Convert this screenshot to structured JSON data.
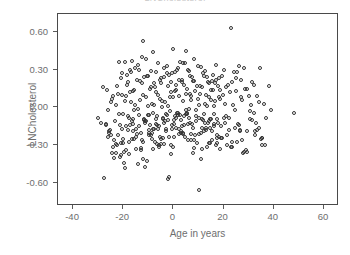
{
  "chart_data": {
    "type": "scatter",
    "title": "LNCholesterol",
    "xlabel": "Age in years",
    "ylabel": "LNCholesterol",
    "xlim": [
      -46,
      66
    ],
    "ylim": [
      -0.78,
      0.74
    ],
    "xticks": [
      -40,
      -20,
      0,
      20,
      40,
      60
    ],
    "xtick_labels": [
      "-40",
      "-20",
      "0",
      "20",
      "40",
      "60"
    ],
    "yticks": [
      0.6,
      0.3,
      0.0,
      -0.3,
      -0.6
    ],
    "ytick_labels": [
      "0.60",
      "0.30",
      "0.00",
      "-0.30",
      "-0.60"
    ],
    "grid": false,
    "legend": null,
    "marker": {
      "shape": "open-circle",
      "size_px": 4,
      "edge_color": "#333333",
      "fill": "none"
    },
    "frame_color": "#4a4a4a",
    "text_color": "#6e6e6e",
    "background": "#ffffff",
    "n_points": 400,
    "series": [
      {
        "name": "observations",
        "x": [
          -27.6,
          -26.4,
          -26.0,
          -25.2,
          -24.6,
          -24.0,
          -23.4,
          -22.8,
          -22.2,
          -21.6,
          -21.0,
          -20.4,
          -20.0,
          -19.4,
          -19.0,
          -18.6,
          -18.0,
          -17.6,
          -17.0,
          -16.4,
          -16.0,
          -15.6,
          -15.0,
          -14.4,
          -14.0,
          -13.6,
          -13.0,
          -12.6,
          -12.0,
          -11.4,
          -11.0,
          -10.6,
          -10.0,
          -9.6,
          -9.0,
          -8.6,
          -8.0,
          -7.6,
          -7.0,
          -6.6,
          -6.0,
          -5.6,
          -5.0,
          -4.6,
          -4.0,
          -3.6,
          -3.0,
          -2.6,
          -2.0,
          -1.6,
          -1.0,
          -0.6,
          0.0,
          0.4,
          1.0,
          1.4,
          2.0,
          2.4,
          3.0,
          3.4,
          4.0,
          4.4,
          5.0,
          5.4,
          6.0,
          6.4,
          7.0,
          7.4,
          8.0,
          8.4,
          9.0,
          9.4,
          10.0,
          10.4,
          11.0,
          11.4,
          12.0,
          12.6,
          13.0,
          13.6,
          14.0,
          14.6,
          15.0,
          15.6,
          16.0,
          16.6,
          17.0,
          17.6,
          18.0,
          18.6,
          19.0,
          20.0,
          21.0,
          22.0,
          23.0,
          24.0,
          25.0,
          26.0,
          27.0,
          28.0,
          -28.0,
          -25.8,
          -24.2,
          -23.0,
          -22.0,
          -21.2,
          -20.6,
          -19.8,
          -19.2,
          -18.4,
          -17.8,
          -17.2,
          -16.6,
          -16.2,
          -15.4,
          -14.8,
          -14.2,
          -13.8,
          -13.2,
          -12.8,
          -12.2,
          -11.8,
          -11.2,
          -10.8,
          -10.2,
          -9.8,
          -9.2,
          -8.8,
          -8.2,
          -7.8,
          -7.2,
          -6.8,
          -6.2,
          -5.8,
          -5.2,
          -4.8,
          -4.2,
          -3.8,
          -3.2,
          -2.8,
          -2.2,
          -1.8,
          -1.2,
          -0.8,
          -0.2,
          0.2,
          0.8,
          1.2,
          1.8,
          2.2,
          2.8,
          3.2,
          3.8,
          4.2,
          4.8,
          5.2,
          5.8,
          6.2,
          6.8,
          7.2,
          7.8,
          8.2,
          8.8,
          9.2,
          9.8,
          10.2,
          10.8,
          11.2,
          11.8,
          12.2,
          12.8,
          13.2,
          13.8,
          14.2,
          14.8,
          15.2,
          15.8,
          16.2,
          16.8,
          17.2,
          17.8,
          18.2,
          18.8,
          19.4,
          20.4,
          21.4,
          22.4,
          23.4,
          24.4,
          25.4,
          26.4,
          27.4,
          28.4,
          29.0,
          30.0,
          31.0,
          32.0,
          33.0,
          34.0,
          35.0,
          -26.8,
          -25.0,
          -23.8,
          -22.6,
          -21.8,
          -20.8,
          -19.6,
          -18.8,
          -18.2,
          -17.4,
          -16.8,
          -15.8,
          -15.2,
          -14.6,
          -13.4,
          -12.4,
          -11.6,
          -10.4,
          -9.4,
          -8.4,
          -7.4,
          -6.4,
          -5.4,
          -4.4,
          -3.4,
          -2.4,
          -1.4,
          -0.4,
          0.6,
          1.6,
          2.6,
          3.6,
          4.6,
          5.6,
          6.6,
          7.6,
          8.6,
          9.6,
          10.6,
          11.6,
          12.4,
          13.4,
          14.4,
          15.4,
          16.4,
          17.4,
          18.4,
          19.8,
          20.8,
          21.8,
          22.8,
          23.8,
          24.8,
          25.8,
          26.8,
          27.8,
          29.4,
          30.4,
          31.4,
          32.4,
          33.4,
          34.4,
          35.4,
          36.0,
          37.0,
          38.0,
          39.0,
          48.0,
          -29.0,
          -30.0,
          -22.4,
          -20.2,
          -18.0,
          -16.0,
          -13.0,
          -11.2,
          -9.0,
          -7.0,
          -5.0,
          -3.0,
          -1.0,
          1.0,
          3.0,
          5.0,
          7.0,
          9.0,
          11.0,
          13.0,
          15.0,
          17.0,
          -24.8,
          -21.4,
          -17.2,
          -14.2,
          -12.0,
          -10.0,
          -8.0,
          -6.0,
          -4.0,
          -2.0,
          0.0,
          2.0,
          4.0,
          6.0,
          8.0,
          10.0,
          12.0,
          14.0,
          16.0,
          18.0,
          -19.0,
          -16.6,
          -12.6,
          -9.6,
          -6.6,
          -3.6,
          -0.6,
          2.4,
          5.4,
          8.4,
          11.4,
          14.4,
          17.4,
          20.4,
          23.4,
          26.4,
          29.4,
          32.4,
          35.4,
          -27.0,
          -23.6,
          -20.6,
          -15.6,
          -11.6,
          -8.6,
          -5.6,
          -2.6,
          0.4,
          3.4,
          6.4,
          9.4,
          12.4,
          15.4,
          18.4,
          21.4,
          24.4,
          27.4,
          30.4,
          33.4,
          36.4,
          -25.6,
          -22.8,
          -19.4,
          -14.8,
          -10.8,
          -7.8,
          -4.8,
          -1.8,
          1.2,
          4.2,
          7.2,
          10.2,
          13.2,
          16.2,
          19.2,
          22.2,
          25.2,
          28.2,
          31.2,
          34.2,
          -26.2,
          -21.0,
          -17.8,
          -13.8,
          -9.8,
          -6.8,
          -3.8,
          -0.8,
          2.2,
          5.2,
          8.2,
          11.2,
          14.2,
          17.2,
          20.2,
          23.2,
          26.2,
          29.2,
          32.2,
          35.2,
          -24.4,
          -20.0,
          -16.2,
          -12.2,
          -8.2,
          -5.2,
          -2.2,
          0.8,
          3.8,
          6.8
        ],
        "y": [
          -0.56,
          0.14,
          -0.02,
          -0.18,
          0.07,
          -0.31,
          -0.11,
          0.02,
          -0.22,
          0.36,
          -0.38,
          0.1,
          -0.05,
          0.36,
          -0.15,
          0.26,
          0.2,
          -0.27,
          0.04,
          0.37,
          -0.09,
          0.14,
          -0.33,
          0.22,
          -0.01,
          0.3,
          -0.2,
          0.4,
          0.53,
          -0.12,
          0.08,
          -0.42,
          0.25,
          -0.06,
          0.16,
          -0.25,
          0.44,
          0.02,
          0.28,
          -0.14,
          0.1,
          -0.3,
          0.19,
          0.05,
          -0.08,
          0.24,
          -0.17,
          0.33,
          0.01,
          -0.23,
          0.12,
          0.27,
          0.46,
          -0.1,
          0.18,
          -0.04,
          0.31,
          0.09,
          -0.19,
          0.22,
          0.35,
          -0.07,
          0.45,
          0.15,
          -0.26,
          0.29,
          0.06,
          -0.13,
          0.21,
          0.38,
          -0.02,
          0.17,
          -0.21,
          0.11,
          0.32,
          -0.09,
          0.25,
          0.03,
          -0.16,
          0.2,
          0.08,
          -0.28,
          0.14,
          0.26,
          -0.05,
          0.19,
          0.34,
          -0.12,
          0.23,
          0.07,
          -0.24,
          0.3,
          0.16,
          -0.08,
          0.63,
          0.28,
          0.13,
          0.33,
          0.22,
          0.31,
          0.16,
          -0.2,
          0.09,
          -0.36,
          0.11,
          -0.14,
          0.27,
          -0.44,
          0.05,
          0.18,
          -0.08,
          0.3,
          -0.25,
          0.13,
          0.02,
          -0.17,
          0.34,
          -0.06,
          0.21,
          -0.32,
          0.1,
          0.24,
          -0.11,
          0.38,
          0.01,
          -0.22,
          0.15,
          0.29,
          -0.04,
          0.19,
          -0.27,
          0.12,
          0.35,
          -0.15,
          0.07,
          0.23,
          -0.09,
          0.31,
          0.04,
          -0.19,
          0.17,
          0.26,
          -0.03,
          0.2,
          0.08,
          -0.13,
          0.28,
          0.14,
          -0.06,
          0.22,
          0.36,
          -0.1,
          0.05,
          0.18,
          -0.23,
          0.11,
          0.3,
          -0.01,
          0.25,
          0.09,
          -0.16,
          0.21,
          0.13,
          -0.07,
          0.33,
          0.02,
          -0.2,
          0.16,
          0.27,
          -0.05,
          0.1,
          0.24,
          -0.12,
          0.19,
          0.06,
          -0.26,
          0.14,
          0.01,
          0.22,
          -0.09,
          0.17,
          0.08,
          -0.15,
          0.25,
          0.03,
          -0.3,
          0.12,
          0.2,
          -0.02,
          0.28,
          -0.18,
          0.06,
          0.15,
          -0.34,
          0.09,
          0.02,
          0.18,
          -0.12,
          0.04,
          -0.25,
          -0.13,
          0.04,
          -0.26,
          0.17,
          -0.05,
          0.23,
          -0.35,
          0.09,
          -0.18,
          0.12,
          0.28,
          -0.02,
          0.31,
          -0.21,
          0.06,
          0.19,
          -0.09,
          0.25,
          -0.14,
          0.03,
          0.16,
          -0.29,
          0.22,
          0.0,
          -0.11,
          0.27,
          0.08,
          -0.17,
          0.13,
          0.3,
          -0.06,
          0.2,
          0.35,
          -0.04,
          0.11,
          0.24,
          -0.22,
          0.07,
          0.17,
          -0.1,
          0.29,
          0.01,
          -0.16,
          0.21,
          0.05,
          -0.28,
          0.14,
          0.1,
          -0.07,
          0.18,
          -0.31,
          0.02,
          0.23,
          -0.13,
          0.08,
          -0.36,
          0.15,
          -0.03,
          0.2,
          -0.19,
          0.09,
          0.31,
          -0.24,
          0.03,
          -0.08,
          0.17,
          -0.02,
          -0.04,
          -0.12,
          -0.08,
          -0.3,
          -0.25,
          -0.07,
          -0.19,
          -0.34,
          -0.47,
          -0.22,
          -0.13,
          -0.29,
          -0.05,
          -0.37,
          -0.16,
          -0.2,
          -0.02,
          -0.26,
          -0.11,
          -0.41,
          -0.18,
          -0.09,
          -0.3,
          -0.22,
          -0.39,
          -0.14,
          -0.45,
          -0.27,
          -0.06,
          -0.33,
          -0.17,
          -0.24,
          -0.1,
          -0.31,
          -0.04,
          -0.21,
          -0.13,
          -0.36,
          -0.08,
          -0.19,
          -0.28,
          -0.15,
          -0.23,
          -0.34,
          -0.11,
          -0.26,
          -0.18,
          -0.07,
          -0.29,
          -0.14,
          -0.21,
          -0.05,
          -0.32,
          -0.16,
          -0.09,
          -0.24,
          -0.12,
          -0.27,
          -0.19,
          -0.35,
          -0.22,
          -0.3,
          -0.14,
          -0.4,
          -0.17,
          -0.25,
          -0.1,
          -0.2,
          -0.31,
          -0.06,
          -0.23,
          -0.15,
          -0.08,
          -0.28,
          -0.12,
          -0.19,
          -0.33,
          -0.22,
          -0.16,
          -0.26,
          -0.09,
          -0.18,
          -0.3,
          -0.19,
          -0.29,
          -0.48,
          -0.23,
          -0.11,
          -0.17,
          -0.25,
          -0.55,
          -0.08,
          -0.14,
          -0.21,
          -0.65,
          -0.31,
          -0.13,
          -0.24,
          -0.18,
          -0.27,
          -0.35,
          -0.1,
          -0.16,
          -0.23,
          -0.28,
          -0.37,
          -0.15,
          -0.2,
          -0.09,
          -0.12,
          -0.3,
          -0.17,
          -0.05,
          -0.26,
          -0.33,
          -0.11,
          -0.22,
          -0.08,
          -0.31,
          -0.14,
          -0.19,
          -0.04,
          -0.24,
          -0.36,
          -0.28,
          -0.13,
          -0.41,
          -0.17,
          -0.23,
          -0.57,
          -0.07,
          -0.2,
          -0.12
        ]
      }
    ]
  }
}
